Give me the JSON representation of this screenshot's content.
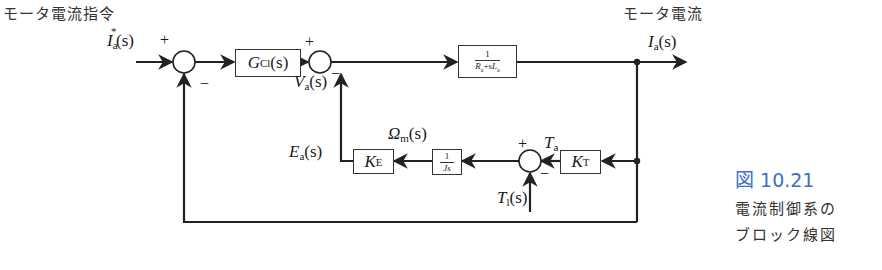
{
  "diagram": {
    "type": "block-diagram",
    "title_labels": {
      "input_title": "モータ電流指令",
      "output_title": "モータ電流"
    },
    "signals": {
      "input": {
        "symbol": "I",
        "sub": "a",
        "sup": "*",
        "arg": "(s)"
      },
      "output": {
        "symbol": "I",
        "sub": "a",
        "arg": "(s)"
      },
      "voltage": {
        "symbol": "V",
        "sub": "a",
        "arg": "(s)"
      },
      "back_emf": {
        "symbol": "E",
        "sub": "a",
        "arg": "(s)"
      },
      "speed": {
        "symbol": "Ω",
        "sub": "m",
        "arg": "(s)"
      },
      "torque": {
        "symbol": "T",
        "sub": "a"
      },
      "load_torque": {
        "symbol": "T",
        "sub": "l",
        "arg": "(s)"
      }
    },
    "blocks": {
      "controller": {
        "symbol": "G",
        "sub": "Cl",
        "arg": "(s)"
      },
      "electrical": {
        "num": "1",
        "den_parts": [
          "R",
          "a",
          "+s",
          "L",
          "a"
        ]
      },
      "kt": {
        "symbol": "K",
        "sub": "T"
      },
      "mechanical": {
        "num": "1",
        "den": "Js"
      },
      "ke": {
        "symbol": "K",
        "sub": "E"
      }
    },
    "signs": {
      "sum1_plus": "+",
      "sum1_minus": "−",
      "sum2_plus": "+",
      "sum2_minus": "−",
      "sum3_plus": "+",
      "sum3_minus": "−"
    },
    "line_color": "#222222"
  },
  "caption": {
    "figure_number": "図 10.21",
    "line1": "電流制御系の",
    "line2": "ブロック線図",
    "accent_color": "#3d6fc6"
  }
}
